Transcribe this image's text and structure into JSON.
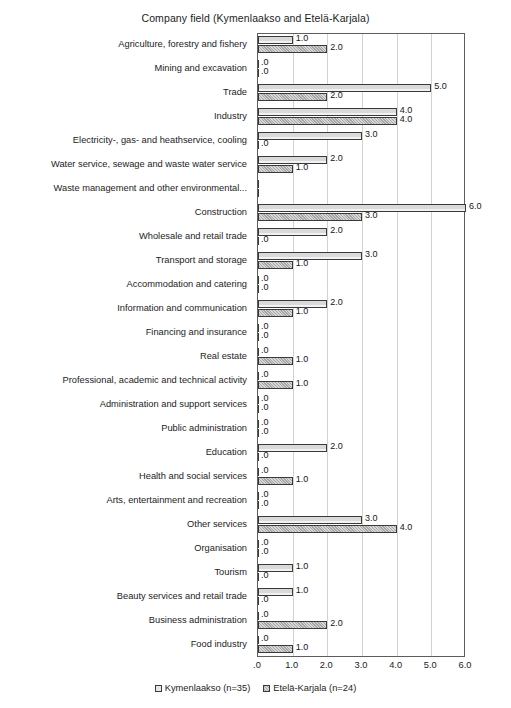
{
  "chart_data": {
    "type": "bar",
    "orientation": "horizontal",
    "title": "Company field (Kymenlaakso and Etelä-Karjala)",
    "xlabel": "",
    "ylabel": "",
    "xlim": [
      0,
      6
    ],
    "xticks": [
      ".0",
      "1.0",
      "2.0",
      "3.0",
      "4.0",
      "5.0",
      "6.0"
    ],
    "xtick_values": [
      0,
      1,
      2,
      3,
      4,
      5,
      6
    ],
    "grid": true,
    "grid_axis": "x",
    "legend_position": "bottom",
    "value_label_format": "0.0",
    "categories": [
      "Agriculture, forestry and fishery",
      "Mining and excavation",
      "Trade",
      "Industry",
      "Electricity-, gas- and heathservice, cooling",
      "Water service, sewage and waste water service",
      "Waste management and other environmental...",
      "Construction",
      "Wholesale and retail trade",
      "Transport and storage",
      "Accommodation and catering",
      "Information and communication",
      "Financing and insurance",
      "Real estate",
      "Professional, academic and technical activity",
      "Administration and support services",
      "Public administration",
      "Education",
      "Health and social services",
      "Arts, entertainment and recreation",
      "Other services",
      "Organisation",
      "Tourism",
      "Beauty services and retail trade",
      "Business administration",
      "Food industry"
    ],
    "series": [
      {
        "name": "Kymenlaakso (n=35)",
        "key": "kymenlaakso",
        "values": [
          1.0,
          0.0,
          5.0,
          4.0,
          3.0,
          2.0,
          0.0,
          6.0,
          2.0,
          3.0,
          0.0,
          2.0,
          0.0,
          0.0,
          0.0,
          0.0,
          0.0,
          2.0,
          0.0,
          0.0,
          3.0,
          0.0,
          1.0,
          1.0,
          0.0,
          0.0
        ],
        "labels": [
          "1.0",
          ".0",
          "5.0",
          "4.0",
          "3.0",
          "2.0",
          "",
          "6.0",
          "2.0",
          "3.0",
          ".0",
          "2.0",
          ".0",
          ".0",
          ".0",
          ".0",
          ".0",
          "2.0",
          ".0",
          ".0",
          "3.0",
          ".0",
          "1.0",
          "1.0",
          ".0",
          ".0"
        ]
      },
      {
        "name": "Etelä-Karjala (n=24)",
        "key": "etela_karjala",
        "values": [
          2.0,
          0.0,
          2.0,
          4.0,
          0.0,
          1.0,
          0.0,
          3.0,
          0.0,
          1.0,
          0.0,
          1.0,
          0.0,
          1.0,
          1.0,
          0.0,
          0.0,
          0.0,
          1.0,
          0.0,
          4.0,
          0.0,
          0.0,
          0.0,
          2.0,
          1.0
        ],
        "labels": [
          "2.0",
          ".0",
          "2.0",
          "4.0",
          ".0",
          "1.0",
          "",
          "3.0",
          ".0",
          "1.0",
          ".0",
          "1.0",
          ".0",
          "1.0",
          "1.0",
          ".0",
          ".0",
          ".0",
          "1.0",
          ".0",
          "4.0",
          ".0",
          ".0",
          ".0",
          "2.0",
          "1.0"
        ]
      }
    ]
  },
  "legend": {
    "items": [
      {
        "label": "Kymenlaakso (n=35)",
        "swatch": "sa"
      },
      {
        "label": "Etelä-Karjala (n=24)",
        "swatch": "sb"
      }
    ]
  },
  "colors": {
    "series_a_fill": "#d9d9d9",
    "series_b_fill": "#a6a6a6",
    "bar_border": "#3a3a3a",
    "grid": "#d2d2d2",
    "frame": "#5d5d5d",
    "text": "#1c1c1c"
  }
}
